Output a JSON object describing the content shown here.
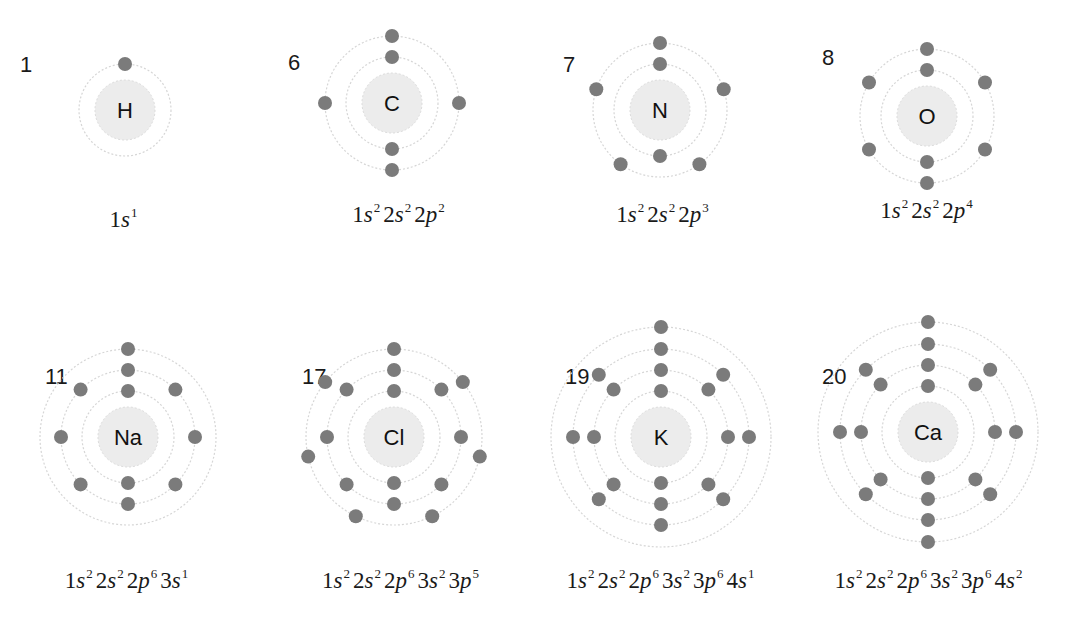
{
  "atoms": [
    {
      "z": "1",
      "symbol": "H",
      "cx": 125,
      "cy": 110,
      "numX": 20,
      "numY": 54,
      "shells": [
        1
      ],
      "offsets": [
        0
      ],
      "config": [
        {
          "n": "1",
          "l": "s",
          "e": "1"
        }
      ],
      "configX": 125,
      "configY": 205
    },
    {
      "z": "6",
      "symbol": "C",
      "cx": 392,
      "cy": 103,
      "numX": 288,
      "numY": 52,
      "shells": [
        2,
        4
      ],
      "offsets": [
        0,
        0
      ],
      "config": [
        {
          "n": "1",
          "l": "s",
          "e": "2"
        },
        {
          "n": "2",
          "l": "s",
          "e": "2"
        },
        {
          "n": "2",
          "l": "p",
          "e": "2"
        }
      ],
      "configX": 400,
      "configY": 200
    },
    {
      "z": "7",
      "symbol": "N",
      "cx": 660,
      "cy": 110,
      "numX": 563,
      "numY": 54,
      "shells": [
        2,
        5
      ],
      "offsets": [
        0,
        0
      ],
      "config": [
        {
          "n": "1",
          "l": "s",
          "e": "2"
        },
        {
          "n": "2",
          "l": "s",
          "e": "2"
        },
        {
          "n": "2",
          "l": "p",
          "e": "3"
        }
      ],
      "configX": 664,
      "configY": 200
    },
    {
      "z": "8",
      "symbol": "O",
      "cx": 927,
      "cy": 116,
      "numX": 822,
      "numY": 47,
      "shells": [
        2,
        6
      ],
      "offsets": [
        0,
        0
      ],
      "config": [
        {
          "n": "1",
          "l": "s",
          "e": "2"
        },
        {
          "n": "2",
          "l": "s",
          "e": "2"
        },
        {
          "n": "2",
          "l": "p",
          "e": "4"
        }
      ],
      "configX": 928,
      "configY": 196
    },
    {
      "z": "11",
      "symbol": "Na",
      "cx": 128,
      "cy": 437,
      "numX": 45,
      "numY": 366,
      "shells": [
        2,
        8,
        1
      ],
      "offsets": [
        0,
        0,
        0
      ],
      "config": [
        {
          "n": "1",
          "l": "s",
          "e": "2"
        },
        {
          "n": "2",
          "l": "s",
          "e": "2"
        },
        {
          "n": "2",
          "l": "p",
          "e": "6"
        },
        {
          "n": "3",
          "l": "s",
          "e": "1"
        }
      ],
      "configX": 128,
      "configY": 566
    },
    {
      "z": "17",
      "symbol": "Cl",
      "cx": 394,
      "cy": 437,
      "numX": 302,
      "numY": 366,
      "shells": [
        2,
        8,
        7
      ],
      "offsets": [
        0,
        0,
        0
      ],
      "config": [
        {
          "n": "1",
          "l": "s",
          "e": "2"
        },
        {
          "n": "2",
          "l": "s",
          "e": "2"
        },
        {
          "n": "2",
          "l": "p",
          "e": "6"
        },
        {
          "n": "3",
          "l": "s",
          "e": "2"
        },
        {
          "n": "3",
          "l": "p",
          "e": "5"
        }
      ],
      "configX": 402,
      "configY": 566
    },
    {
      "z": "19",
      "symbol": "K",
      "cx": 661,
      "cy": 437,
      "numX": 565,
      "numY": 366,
      "shells": [
        2,
        8,
        8,
        1
      ],
      "offsets": [
        0,
        0,
        0,
        0
      ],
      "config": [
        {
          "n": "1",
          "l": "s",
          "e": "2"
        },
        {
          "n": "2",
          "l": "s",
          "e": "2"
        },
        {
          "n": "2",
          "l": "p",
          "e": "6"
        },
        {
          "n": "3",
          "l": "s",
          "e": "2"
        },
        {
          "n": "3",
          "l": "p",
          "e": "6"
        },
        {
          "n": "4",
          "l": "s",
          "e": "1"
        }
      ],
      "configX": 662,
      "configY": 566
    },
    {
      "z": "20",
      "symbol": "Ca",
      "cx": 928,
      "cy": 432,
      "numX": 822,
      "numY": 366,
      "shells": [
        2,
        8,
        8,
        2
      ],
      "offsets": [
        0,
        0,
        0,
        0
      ],
      "config": [
        {
          "n": "1",
          "l": "s",
          "e": "2"
        },
        {
          "n": "2",
          "l": "s",
          "e": "2"
        },
        {
          "n": "2",
          "l": "p",
          "e": "6"
        },
        {
          "n": "3",
          "l": "s",
          "e": "2"
        },
        {
          "n": "3",
          "l": "p",
          "e": "6"
        },
        {
          "n": "4",
          "l": "s",
          "e": "2"
        }
      ],
      "configX": 930,
      "configY": 566
    }
  ],
  "style": {
    "nucleus_radius": 30,
    "shell_radii": [
      46,
      67,
      88,
      110
    ],
    "electron_radius": 7,
    "electron_color": "#7b7b7b",
    "orbit_color": "#d6d6d6",
    "nucleus_color": "#ececec"
  }
}
